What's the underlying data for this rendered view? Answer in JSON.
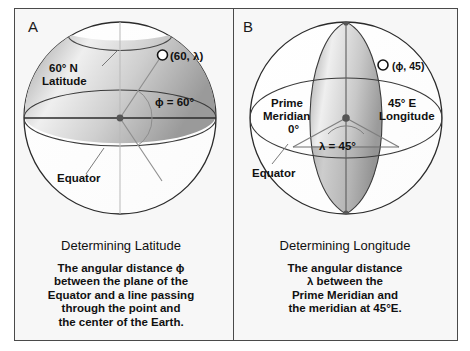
{
  "figure": {
    "panels": [
      {
        "letter": "A",
        "title": "Determining Latitude",
        "caption_lines": [
          "The angular distance ϕ",
          "between the plane of the",
          "Equator and a line passing",
          "through the point and",
          "the center of the Earth."
        ],
        "labels": {
          "latitude_circle_line1": "60° N",
          "latitude_circle_line2": "Latitude",
          "point": "(60, λ)",
          "angle": "ϕ = 60°",
          "equator": "Equator"
        }
      },
      {
        "letter": "B",
        "title": "Determining Longitude",
        "caption_lines": [
          "The angular distance",
          "λ between the",
          "Prime Meridian and",
          "the meridian at 45°E."
        ],
        "labels": {
          "prime_meridian_line1": "Prime",
          "prime_meridian_line2": "Meridian",
          "prime_meridian_line3": "0°",
          "longitude_line1": "45° E",
          "longitude_line2": "Longitude",
          "point": "(ϕ, 45)",
          "angle": "λ = 45°",
          "equator": "Equator"
        }
      }
    ],
    "colors": {
      "frame_border": "#4a4a4a",
      "panel_background": "#f7f7f7",
      "globe_outline": "#2b2b2b",
      "shade_light": "#f2f2f2",
      "shade_mid": "#d4d4d4",
      "shade_dark": "#a8a8a8",
      "text": "#111111"
    }
  }
}
